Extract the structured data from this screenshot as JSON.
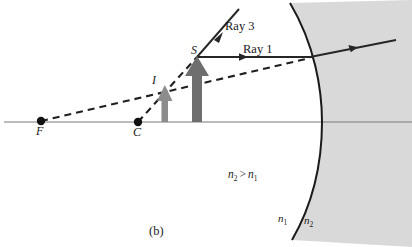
{
  "figure": {
    "caption": "(b)",
    "condition_n2": "n",
    "condition_sub2": "2",
    "condition_op": ">",
    "condition_n1": "n",
    "condition_sub1": "1"
  },
  "points": [
    {
      "id": "focal-point",
      "label": "F",
      "x": 41,
      "y": 121
    },
    {
      "id": "center-of-curvature",
      "label": "C",
      "x": 138,
      "y": 122
    }
  ],
  "arrows": [
    {
      "id": "image-arrow",
      "label": "I",
      "x": 165,
      "base_y": 122,
      "tip_y": 85,
      "color": "#8c8c8c"
    },
    {
      "id": "object-arrow",
      "label": "S",
      "x": 197,
      "base_y": 122,
      "tip_y": 57,
      "color": "#6e6e6e"
    }
  ],
  "rays": [
    {
      "id": "ray-1",
      "label": "Ray 1"
    },
    {
      "id": "ray-3",
      "label": "Ray 3"
    }
  ],
  "media": [
    {
      "id": "medium-1",
      "label": "n",
      "sub": "1",
      "x": 280,
      "y": 220
    },
    {
      "id": "medium-2",
      "label": "n",
      "sub": "2",
      "x": 306,
      "y": 222
    }
  ],
  "colors": {
    "axis": "#7a7a7a",
    "ray": "#262626",
    "dashed": "#1f1f1f",
    "surface": "#1a1a1a",
    "medium2_fill": "#d9d9d9",
    "arrow_image": "#8c8c8c",
    "arrow_object": "#6e6e6e",
    "text": "#1a1a1a"
  }
}
